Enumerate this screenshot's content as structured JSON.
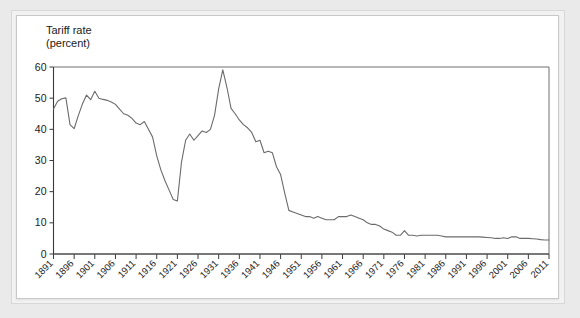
{
  "chart_data": {
    "type": "line",
    "title_line1": "Tariff rate",
    "title_line2": "(percent)",
    "xlabel": "",
    "ylabel": "Tariff rate (percent)",
    "xlim": [
      1891,
      2011
    ],
    "ylim": [
      0,
      60
    ],
    "yticks": [
      0,
      10,
      20,
      30,
      40,
      50,
      60
    ],
    "ytick_labels": [
      "0",
      "10",
      "20",
      "30",
      "40",
      "50",
      "60"
    ],
    "xticks": [
      1891,
      1896,
      1901,
      1906,
      1911,
      1916,
      1921,
      1926,
      1931,
      1936,
      1941,
      1946,
      1951,
      1956,
      1961,
      1966,
      1971,
      1976,
      1981,
      1986,
      1991,
      1996,
      2001,
      2006,
      2011
    ],
    "xtick_labels": [
      "1891",
      "1896",
      "1901",
      "1906",
      "1911",
      "1916",
      "1921",
      "1926",
      "1931",
      "1936",
      "1941",
      "1946",
      "1951",
      "1956",
      "1961",
      "1966",
      "1971",
      "1976",
      "1981",
      "1986",
      "1991",
      "1996",
      "2001",
      "2006",
      "2011"
    ],
    "xtick_rotation": 45,
    "grid": false,
    "legend": false,
    "line_color": "#6b6b6b",
    "series": [
      {
        "name": "Tariff rate (percent)",
        "x": [
          1891,
          1892,
          1893,
          1894,
          1895,
          1896,
          1897,
          1898,
          1899,
          1900,
          1901,
          1902,
          1903,
          1904,
          1905,
          1906,
          1907,
          1908,
          1909,
          1910,
          1911,
          1912,
          1913,
          1914,
          1915,
          1916,
          1917,
          1918,
          1919,
          1920,
          1921,
          1922,
          1923,
          1924,
          1925,
          1926,
          1927,
          1928,
          1929,
          1930,
          1931,
          1932,
          1933,
          1934,
          1935,
          1936,
          1937,
          1938,
          1939,
          1940,
          1941,
          1942,
          1943,
          1944,
          1945,
          1946,
          1947,
          1948,
          1949,
          1950,
          1951,
          1952,
          1953,
          1954,
          1955,
          1956,
          1957,
          1958,
          1959,
          1960,
          1961,
          1962,
          1963,
          1964,
          1965,
          1966,
          1967,
          1968,
          1969,
          1970,
          1971,
          1972,
          1973,
          1974,
          1975,
          1976,
          1977,
          1978,
          1979,
          1980,
          1981,
          1982,
          1983,
          1984,
          1985,
          1986,
          1987,
          1988,
          1989,
          1990,
          1991,
          1992,
          1993,
          1994,
          1995,
          1996,
          1997,
          1998,
          1999,
          2000,
          2001,
          2002,
          2003,
          2004,
          2005,
          2006,
          2007,
          2008,
          2009,
          2010,
          2011
        ],
        "values": [
          46.5,
          49.0,
          49.8,
          50.1,
          41.5,
          40.2,
          44.4,
          48.1,
          51.0,
          49.5,
          52.2,
          50.0,
          49.6,
          49.3,
          48.8,
          48.0,
          46.5,
          45.0,
          44.5,
          43.5,
          42.0,
          41.5,
          42.5,
          40.0,
          37.5,
          31.5,
          27.0,
          23.5,
          20.5,
          17.5,
          17.0,
          29.5,
          36.5,
          38.5,
          36.5,
          38.0,
          39.5,
          39.0,
          40.0,
          44.5,
          53.0,
          59.1,
          53.5,
          46.7,
          45.0,
          43.0,
          41.5,
          40.5,
          39.0,
          36.0,
          36.5,
          32.5,
          33.0,
          32.5,
          28.0,
          25.5,
          19.5,
          14.0,
          13.5,
          13.0,
          12.5,
          12.0,
          12.0,
          11.5,
          12.0,
          11.5,
          11.0,
          11.0,
          11.0,
          12.0,
          12.0,
          12.0,
          12.5,
          12.0,
          11.5,
          11.0,
          10.0,
          9.5,
          9.5,
          9.0,
          8.0,
          7.5,
          7.0,
          6.0,
          6.0,
          7.5,
          6.0,
          6.0,
          5.8,
          6.0,
          6.0,
          6.0,
          6.0,
          6.0,
          5.8,
          5.5,
          5.5,
          5.5,
          5.5,
          5.5,
          5.5,
          5.5,
          5.5,
          5.5,
          5.4,
          5.3,
          5.2,
          5.0,
          5.0,
          5.2,
          5.0,
          5.5,
          5.5,
          5.0,
          5.0,
          5.0,
          4.9,
          4.8,
          4.6,
          4.5,
          4.5
        ]
      }
    ]
  }
}
